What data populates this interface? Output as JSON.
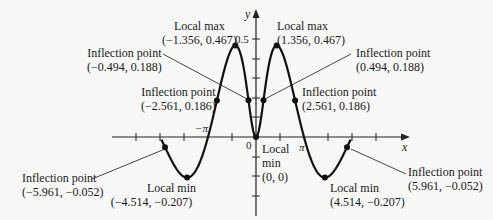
{
  "figure": {
    "function": "f(x) = x sin(x) / (1 + x^2)",
    "axes": {
      "x_label": "x",
      "y_label": "y",
      "y_tick_label": "0.5",
      "origin_label": "0",
      "pi_label": "π",
      "neg_pi_label": "−π"
    },
    "annotations": {
      "local_max_left": {
        "title": "Local max",
        "coords": "(−1.356, 0.467)"
      },
      "local_max_right": {
        "title": "Local max",
        "coords": "(1.356, 0.467)"
      },
      "inflection_left_inner": {
        "title": "Inflection point",
        "coords": "(−0.494, 0.188)"
      },
      "inflection_right_inner": {
        "title": "Inflection point",
        "coords": "(0.494, 0.188)"
      },
      "inflection_left_mid": {
        "title": "Inflection point",
        "coords": "(−2.561, 0.186)"
      },
      "inflection_right_mid": {
        "title": "Inflection point",
        "coords": "(2.561, 0.186)"
      },
      "local_min_origin": {
        "title1": "Local",
        "title2": "min",
        "coords": "(0, 0)"
      },
      "local_min_left": {
        "title": "Local min",
        "coords": "(−4.514, −0.207)"
      },
      "local_min_right": {
        "title": "Local min",
        "coords": "(4.514, −0.207)"
      },
      "inflection_left_outer": {
        "title": "Inflection point",
        "coords": "(−5.961, −0.052)"
      },
      "inflection_right_outer": {
        "title": "Inflection point",
        "coords": "(5.961, −0.052)"
      }
    },
    "colors": {
      "curve": "#111111",
      "axis": "#222222",
      "background": "#f7f7f5"
    }
  }
}
